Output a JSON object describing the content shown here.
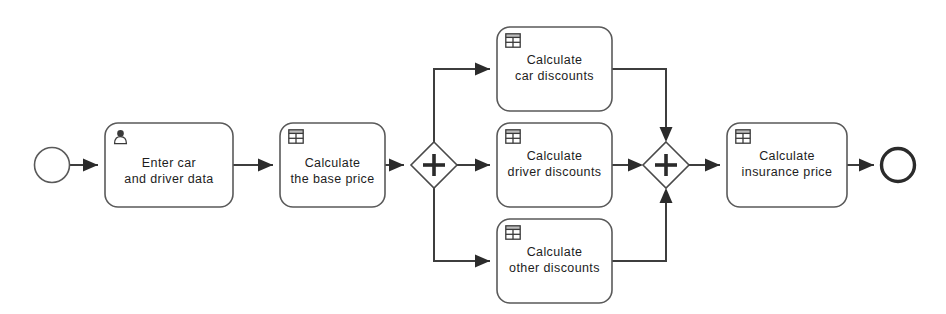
{
  "diagram": {
    "type": "bpmn-process",
    "canvas": {
      "width": 946,
      "height": 314,
      "background": "#ffffff"
    },
    "colors": {
      "shape_stroke": "#5a5a5a",
      "flow_stroke": "#3d3d3d",
      "end_event_stroke": "#2b2b2b",
      "text": "#1d1d1d",
      "icon": "#3a3a3a",
      "background": "#ffffff"
    }
  },
  "events": [
    {
      "id": "start-event",
      "kind": "start",
      "label": "",
      "cx": 52,
      "cy": 165,
      "r": 17.5,
      "stroke_width": 1.6
    },
    {
      "id": "end-event",
      "kind": "end",
      "label": "",
      "cx": 898,
      "cy": 165,
      "r": 16.5,
      "stroke_width": 3.4
    }
  ],
  "tasks": [
    {
      "id": "task-enter-car-and-driver-data",
      "icon": "user-icon",
      "line1": "Enter car",
      "line2": "and driver data",
      "x": 105,
      "y": 123,
      "w": 128,
      "h": 84
    },
    {
      "id": "task-calculate-the-base-price",
      "icon": "table-icon",
      "line1": "Calculate",
      "line2": "the base price",
      "x": 280,
      "y": 123,
      "w": 105,
      "h": 84
    },
    {
      "id": "task-calculate-car-discounts",
      "icon": "table-icon",
      "line1": "Calculate",
      "line2": "car discounts",
      "x": 497,
      "y": 27,
      "w": 115,
      "h": 84
    },
    {
      "id": "task-calculate-driver-discounts",
      "icon": "table-icon",
      "line1": "Calculate",
      "line2": "driver discounts",
      "x": 497,
      "y": 123,
      "w": 115,
      "h": 84
    },
    {
      "id": "task-calculate-other-discounts",
      "icon": "table-icon",
      "line1": "Calculate",
      "line2": "other discounts",
      "x": 497,
      "y": 219,
      "w": 115,
      "h": 84
    },
    {
      "id": "task-calculate-insurance-price",
      "icon": "table-icon",
      "line1": "Calculate",
      "line2": "insurance price",
      "x": 727,
      "y": 123,
      "w": 120,
      "h": 84
    }
  ],
  "gateways": [
    {
      "id": "gateway-parallel-split",
      "kind": "parallel",
      "symbol": "+",
      "label": "",
      "cx": 434,
      "cy": 165,
      "rx": 23,
      "ry": 23
    },
    {
      "id": "gateway-parallel-join",
      "kind": "parallel",
      "symbol": "+",
      "label": "",
      "cx": 666,
      "cy": 165,
      "rx": 23,
      "ry": 23
    }
  ],
  "flows": [
    {
      "id": "flow-start-to-enter-data",
      "label": "",
      "path": "M 70 165 L 98 165"
    },
    {
      "id": "flow-enter-data-to-base-price",
      "label": "",
      "path": "M 233 165 L 273 165"
    },
    {
      "id": "flow-base-price-to-split",
      "label": "",
      "path": "M 385 165 L 404 165"
    },
    {
      "id": "flow-split-to-car-discounts",
      "label": "",
      "path": "M 434 142 L 434 69 L 490 69"
    },
    {
      "id": "flow-split-to-driver-discounts",
      "label": "",
      "path": "M 457 165 L 490 165"
    },
    {
      "id": "flow-split-to-other-discounts",
      "label": "",
      "path": "M 434 188 L 434 261 L 490 261"
    },
    {
      "id": "flow-car-discounts-to-join",
      "label": "",
      "path": "M 612 69 L 666 69 L 666 135"
    },
    {
      "id": "flow-driver-discounts-to-join",
      "label": "",
      "path": "M 612 165 L 636 165"
    },
    {
      "id": "flow-other-discounts-to-join",
      "label": "",
      "path": "M 612 261 L 666 261 L 666 195"
    },
    {
      "id": "flow-join-to-insurance-price",
      "label": "",
      "path": "M 689 165 L 720 165"
    },
    {
      "id": "flow-insurance-price-to-end",
      "label": "",
      "path": "M 847 165 L 874 165"
    }
  ],
  "arrowheads": [
    {
      "id": "arrow-into-enter-data",
      "x": 98,
      "y": 165,
      "dir": "right"
    },
    {
      "id": "arrow-into-base-price",
      "x": 273,
      "y": 165,
      "dir": "right"
    },
    {
      "id": "arrow-into-split",
      "x": 404,
      "y": 165,
      "dir": "right"
    },
    {
      "id": "arrow-into-car-discounts",
      "x": 490,
      "y": 69,
      "dir": "right"
    },
    {
      "id": "arrow-into-driver-discounts",
      "x": 490,
      "y": 165,
      "dir": "right"
    },
    {
      "id": "arrow-into-other-discounts",
      "x": 490,
      "y": 261,
      "dir": "right"
    },
    {
      "id": "arrow-into-join-top",
      "x": 666,
      "y": 135,
      "dir": "down"
    },
    {
      "id": "arrow-into-join-left",
      "x": 636,
      "y": 165,
      "dir": "right"
    },
    {
      "id": "arrow-into-join-bottom",
      "x": 666,
      "y": 195,
      "dir": "up"
    },
    {
      "id": "arrow-into-insurance-price",
      "x": 720,
      "y": 165,
      "dir": "right"
    },
    {
      "id": "arrow-into-end-event",
      "x": 874,
      "y": 165,
      "dir": "right"
    }
  ]
}
